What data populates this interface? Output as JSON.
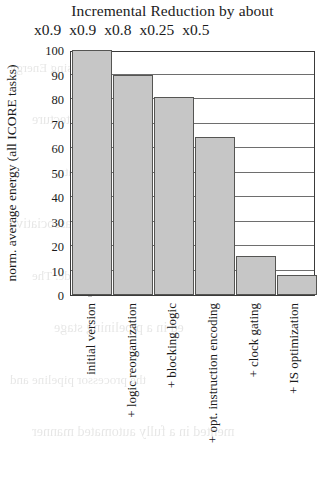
{
  "chart_data": {
    "type": "bar",
    "title": "Incremental Reduction by about",
    "xlabel": "",
    "ylabel": "norm. average energy (all ICORE tasks)",
    "ylim": [
      0,
      100
    ],
    "yticks": [
      100,
      90,
      80,
      70,
      60,
      50,
      40,
      30,
      20,
      10,
      0
    ],
    "grid": true,
    "legend": "none",
    "categories": [
      "initial version",
      "+ logic reorganization",
      "+ blocking logic",
      "+ opt. instruction encoding",
      "+ clock gating",
      "+ IS optimization"
    ],
    "values": [
      100,
      90,
      81,
      64.5,
      16,
      8
    ],
    "annotations": {
      "label": "Incremental Reduction by about",
      "multipliers": [
        "x0.9",
        "x0.9",
        "x0.8",
        "x0.25",
        "x0.5"
      ]
    },
    "colors": {
      "bar_fill": "#c6c6c6",
      "bar_stroke": "#555553",
      "grid": "#6e6e6e",
      "axis": "#3a3a3a",
      "text": "#1b1b1b",
      "background": "#ffffff"
    }
  },
  "bleed_through": {
    "lines": [
      "e Study: Increasing Energy",
      "ncy exposing the Architecture",
      "ed cache with 3 ways in a 512-entry",
      "emory line identifier, fully associative",
      "in a low-power mode. The",
      "ed in a pipelining stage",
      "the processor pipeline and",
      "mented in a fully automated manner"
    ]
  }
}
